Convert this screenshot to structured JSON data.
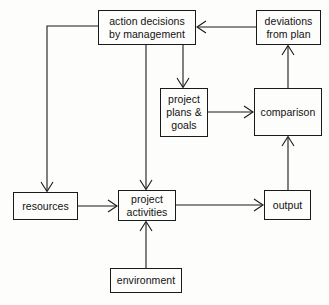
{
  "diagram": {
    "stroke_color": "#1a1a1a",
    "background_color": "#fdfdfb",
    "text_color": "#111111",
    "nodes": [
      {
        "id": "action_decisions",
        "label_line1": "action decisions",
        "label_line2": "by management"
      },
      {
        "id": "deviations",
        "label_line1": "deviations",
        "label_line2": "from plan"
      },
      {
        "id": "plans",
        "label_line1": "project",
        "label_line2": "plans &",
        "label_line3": "goals"
      },
      {
        "id": "comparison",
        "label_line1": "comparison"
      },
      {
        "id": "resources",
        "label_line1": "resources"
      },
      {
        "id": "activities",
        "label_line1": "project",
        "label_line2": "activities"
      },
      {
        "id": "output",
        "label_line1": "output"
      },
      {
        "id": "environment",
        "label_line1": "environment"
      }
    ],
    "edges": [
      {
        "from": "deviations",
        "to": "action_decisions",
        "style": "horizontal-left"
      },
      {
        "from": "action_decisions",
        "to": "resources",
        "style": "elbow-left-down"
      },
      {
        "from": "action_decisions",
        "to": "activities",
        "style": "vertical-down"
      },
      {
        "from": "action_decisions",
        "to": "plans",
        "style": "vertical-down"
      },
      {
        "from": "plans",
        "to": "comparison",
        "style": "horizontal-right"
      },
      {
        "from": "comparison",
        "to": "deviations",
        "style": "vertical-up"
      },
      {
        "from": "output",
        "to": "comparison",
        "style": "vertical-up"
      },
      {
        "from": "resources",
        "to": "activities",
        "style": "horizontal-right"
      },
      {
        "from": "activities",
        "to": "output",
        "style": "horizontal-right"
      },
      {
        "from": "environment",
        "to": "activities",
        "style": "vertical-up"
      }
    ]
  }
}
